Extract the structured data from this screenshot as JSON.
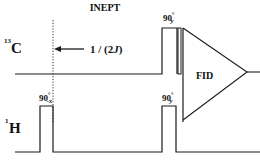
{
  "title": "INEPT",
  "channels": {
    "carbon": {
      "label_sup": "13",
      "label": "C"
    },
    "proton": {
      "label_sup": "1",
      "label": "H"
    }
  },
  "delay": {
    "label_pre": "1 / (2",
    "label_j": "J",
    "label_post": ")"
  },
  "pulses": {
    "h_first": {
      "angle": "90",
      "deg": "°",
      "phase": "-x"
    },
    "h_second": {
      "angle": "90",
      "deg": "°",
      "phase": "y"
    },
    "c_pulse": {
      "angle": "90",
      "deg": "°",
      "phase": "y"
    }
  },
  "acquisition": {
    "label": "FID"
  },
  "colors": {
    "line": "#1a1a1a",
    "background": "#ffffff"
  }
}
